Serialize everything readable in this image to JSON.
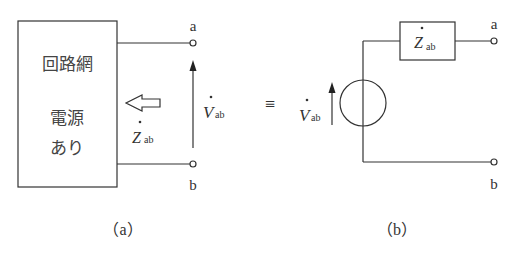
{
  "figure_a": {
    "box_line1": "回路網",
    "box_line2": "電源",
    "box_line3": "あり",
    "terminal_a": "a",
    "terminal_b": "b",
    "voltage_symbol": "V",
    "voltage_sub": "ab",
    "impedance_symbol": "Z",
    "impedance_sub": "ab",
    "caption": "（a）"
  },
  "equivalence": "≡",
  "figure_b": {
    "voltage_symbol": "V",
    "voltage_sub": "ab",
    "impedance_symbol": "Z",
    "impedance_sub": "ab",
    "terminal_a": "a",
    "terminal_b": "b",
    "caption": "（b）"
  }
}
